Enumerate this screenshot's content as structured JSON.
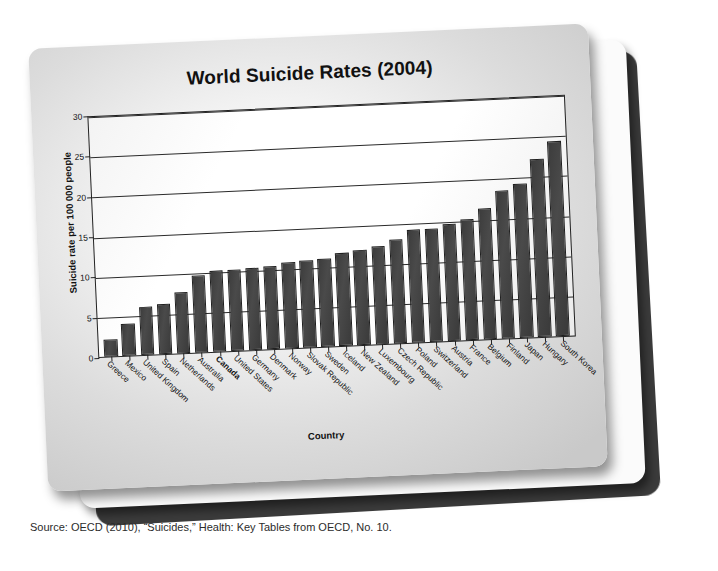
{
  "card": {
    "source_caption": "Source: OECD (2010), “Suicides,” Health: Key Tables from OECD, No. 10."
  },
  "colors": {
    "bar_fill": "#3d3d3d",
    "bar_stroke": "#1f1f1f",
    "axis": "#222222",
    "plot_background": "#ffffff",
    "card_front": "#e9e9e9",
    "card_shadow": "#3b3b3b"
  },
  "chart_data": {
    "type": "bar",
    "title": "World Suicide Rates (2004)",
    "xlabel": "Country",
    "ylabel": "Suicide rate per 100 000 people",
    "ylim": [
      0,
      30
    ],
    "yticks": [
      0,
      5,
      10,
      15,
      20,
      25,
      30
    ],
    "grid": true,
    "legend": null,
    "highlight": "Canada",
    "categories": [
      "Greece",
      "Mexico",
      "United Kingdom",
      "Spain",
      "Netherlands",
      "Australia",
      "Canada",
      "United States",
      "Germany",
      "Denmark",
      "Norway",
      "Slovak Republic",
      "Sweden",
      "Iceland",
      "New Zealand",
      "Luxembourg",
      "Czech Republic",
      "Poland",
      "Switzerland",
      "Austria",
      "France",
      "Belgium",
      "Finland",
      "Japan",
      "Hungary",
      "South Korea"
    ],
    "values": [
      2.1,
      4.0,
      5.9,
      6.2,
      7.6,
      9.6,
      10.1,
      10.1,
      10.2,
      10.3,
      10.7,
      10.8,
      10.9,
      11.5,
      11.8,
      12.2,
      12.9,
      14.0,
      14.0,
      14.5,
      15.0,
      16.2,
      18.3,
      19.1,
      22.1,
      24.2
    ]
  }
}
